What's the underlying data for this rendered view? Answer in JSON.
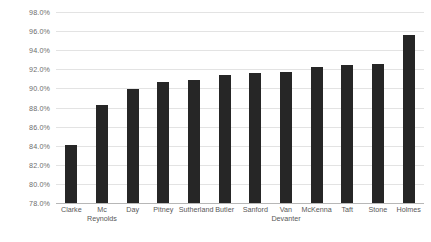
{
  "chart_data": {
    "type": "bar",
    "title": "",
    "subtitle": "",
    "xlabel": "",
    "ylabel": "",
    "categories": [
      "Clarke",
      "Mc Reynolds",
      "Day",
      "Pitney",
      "Sutherland",
      "Butler",
      "Sanford",
      "Van Devanter",
      "McKenna",
      "Taft",
      "Stone",
      "Holmes"
    ],
    "values": [
      84.1,
      88.3,
      89.9,
      90.7,
      90.9,
      91.4,
      91.6,
      91.7,
      92.2,
      92.5,
      92.6,
      95.6
    ],
    "value_format": "percent",
    "ylim": [
      78.0,
      98.0
    ],
    "ytick_values": [
      78.0,
      80.0,
      82.0,
      84.0,
      86.0,
      88.0,
      90.0,
      92.0,
      94.0,
      96.0,
      98.0
    ],
    "ytick_labels": [
      "78.0%",
      "80.0%",
      "82.0%",
      "84.0%",
      "86.0%",
      "88.0%",
      "90.0%",
      "92.0%",
      "94.0%",
      "96.0%",
      "98.0%"
    ],
    "grid": true,
    "grid_axis": "y",
    "legend": false,
    "legend_position": "none",
    "bar_color": "#262626",
    "gridline_color": "#e3e3e3",
    "axis_color": "#b7b7b7",
    "tick_label_color": "#6d6d6d",
    "category_label_color": "#585858",
    "background_color": "#ffffff"
  }
}
